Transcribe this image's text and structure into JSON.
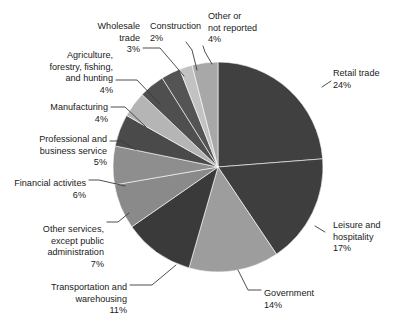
{
  "chart_data": {
    "type": "pie",
    "title": "",
    "subtitle": "",
    "xlabel": "",
    "ylabel": "",
    "legend_position": "none",
    "grid": false,
    "labels_show_percent": true,
    "start_angle_deg": 0,
    "direction": "clockwise",
    "total_percent": 100,
    "categories": [
      "Retail trade",
      "Leisure and hospitality",
      "Government",
      "Transportation and warehousing",
      "Other services, except public administration",
      "Financial activites",
      "Professional and business service",
      "Manufacturing",
      "Agriculture, forestry, fishing, and hunting",
      "Wholesale trade",
      "Construction",
      "Other or not reported"
    ],
    "values": [
      24,
      17,
      14,
      11,
      7,
      6,
      5,
      4,
      4,
      3,
      2,
      4
    ],
    "colors": [
      "#404040",
      "#3e3e3e",
      "#9d9d9d",
      "#3a3a3a",
      "#8a8a8a",
      "#8e8e8e",
      "#4a4a4a",
      "#b5b5b5",
      "#4f4f4f",
      "#545454",
      "#c2c2c2",
      "#a8a8a8"
    ],
    "slices": [
      {
        "label": "Retail trade",
        "value": 24,
        "percent_text": "24%",
        "color": "#404040",
        "label_lines": [
          "Retail trade"
        ],
        "label_x": 333,
        "label_y": 76,
        "anchor": "start"
      },
      {
        "label": "Leisure and hospitality",
        "value": 17,
        "percent_text": "17%",
        "color": "#3e3e3e",
        "label_lines": [
          "Leisure and",
          "hospitality"
        ],
        "label_x": 333,
        "label_y": 228,
        "anchor": "start"
      },
      {
        "label": "Government",
        "value": 14,
        "percent_text": "14%",
        "color": "#9d9d9d",
        "label_lines": [
          "Government"
        ],
        "label_x": 264,
        "label_y": 296,
        "anchor": "start"
      },
      {
        "label": "Transportation and warehousing",
        "value": 11,
        "percent_text": "11%",
        "color": "#3a3a3a",
        "label_lines": [
          "Transportation and",
          "warehousing"
        ],
        "label_x": 127,
        "label_y": 290,
        "anchor": "end"
      },
      {
        "label": "Other services, except public administration",
        "value": 7,
        "percent_text": "7%",
        "color": "#8a8a8a",
        "label_lines": [
          "Other services,",
          "except public",
          "administration"
        ],
        "label_x": 104,
        "label_y": 232,
        "anchor": "end"
      },
      {
        "label": "Financial activites",
        "value": 6,
        "percent_text": "6%",
        "color": "#8e8e8e",
        "label_lines": [
          "Financial activites"
        ],
        "label_x": 86,
        "label_y": 186,
        "anchor": "end"
      },
      {
        "label": "Professional and business service",
        "value": 5,
        "percent_text": "5%",
        "color": "#4a4a4a",
        "label_lines": [
          "Professional and",
          "business service"
        ],
        "label_x": 107,
        "label_y": 142,
        "anchor": "end"
      },
      {
        "label": "Manufacturing",
        "value": 4,
        "percent_text": "4%",
        "color": "#b5b5b5",
        "label_lines": [
          "Manufacturing"
        ],
        "label_x": 108,
        "label_y": 110,
        "anchor": "end"
      },
      {
        "label": "Agriculture, forestry, fishing, and hunting",
        "value": 4,
        "percent_text": "4%",
        "color": "#4f4f4f",
        "label_lines": [
          "Agriculture,",
          "forestry, fishing,",
          "and hunting"
        ],
        "label_x": 113,
        "label_y": 58,
        "anchor": "end"
      },
      {
        "label": "Wholesale trade",
        "value": 3,
        "percent_text": "3%",
        "color": "#545454",
        "label_lines": [
          "Wholesale",
          "trade"
        ],
        "label_x": 140,
        "label_y": 29,
        "anchor": "end"
      },
      {
        "label": "Construction",
        "value": 2,
        "percent_text": "2%",
        "color": "#c2c2c2",
        "label_lines": [
          "Construction"
        ],
        "label_x": 150,
        "label_y": 29,
        "anchor": "start"
      },
      {
        "label": "Other or not reported",
        "value": 4,
        "percent_text": "4%",
        "color": "#a8a8a8",
        "label_lines": [
          "Other or",
          "not reported"
        ],
        "label_x": 208,
        "label_y": 19,
        "anchor": "start"
      }
    ],
    "geometry": {
      "center_x": 218,
      "center_y": 167,
      "radius": 105
    },
    "leaders": [
      {
        "name": "retail-trade",
        "points": "322,87 331,81"
      },
      {
        "name": "leisure-and-hospitality",
        "points": "315,226 325,232"
      },
      {
        "name": "government",
        "points": "238,270 248,290 261,290"
      },
      {
        "name": "transportation-and-warehousing",
        "points": "176,265 152,285 130,285"
      },
      {
        "name": "other-services",
        "points": "129,213 118,222 107,222"
      },
      {
        "name": "financial-activites",
        "points": "125,186 99,180 89,180"
      },
      {
        "name": "professional-and-business-service",
        "points": "136,150 122,141 110,141"
      },
      {
        "name": "manufacturing",
        "points": "146,127 125,107 111,107"
      },
      {
        "name": "agriculture-forestry-fishing-and-hunting",
        "points": "160,104 137,80 116,80"
      },
      {
        "name": "wholesale-trade",
        "points": "184,76 160,48 143,48"
      },
      {
        "name": "construction",
        "points": "197,70 192,50 186,42"
      },
      {
        "name": "other-or-not-reported",
        "points": "212,64 205,52 203,46"
      }
    ]
  }
}
